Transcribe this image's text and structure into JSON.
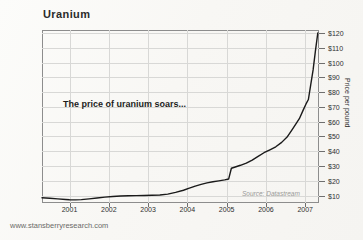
{
  "title": "Uranium",
  "annotation": "The price of uranium soars...",
  "source_note": "Source: Datastream",
  "footer_url": "www.stansberryresearch.com",
  "colors": {
    "line": "#1a1a1a",
    "grid": "#d8d8d6",
    "frame": "#8d8d8d",
    "text": "#2f2f2f",
    "source_text": "#9a9a98",
    "background": "#fbfaf8"
  },
  "chart_data": {
    "type": "line",
    "title": "Uranium",
    "xlabel": "",
    "ylabel": "Price per pound",
    "annotation": "The price of uranium soars...",
    "source": "Source: Datastream",
    "grid": true,
    "legend": "none",
    "xlim": [
      2000.3,
      2007.35
    ],
    "ylim": [
      5,
      122
    ],
    "xticks": [
      "2001",
      "2002",
      "2003",
      "2004",
      "2005",
      "2006",
      "2007"
    ],
    "ytick_labels": [
      "$10",
      "$20",
      "$30",
      "$40",
      "$50",
      "$60",
      "$70",
      "$80",
      "$90",
      "$100",
      "$110",
      "$120"
    ],
    "ytick_values": [
      10,
      20,
      30,
      40,
      50,
      60,
      70,
      80,
      90,
      100,
      110,
      120
    ],
    "series": [
      {
        "name": "Uranium spot price (US$ per pound)",
        "x": [
          2000.3,
          2000.5,
          2000.7,
          2000.9,
          2001.0,
          2001.15,
          2001.3,
          2001.5,
          2001.7,
          2001.9,
          2002.1,
          2002.3,
          2002.5,
          2002.7,
          2002.9,
          2003.1,
          2003.3,
          2003.5,
          2003.7,
          2003.9,
          2004.05,
          2004.2,
          2004.35,
          2004.5,
          2004.65,
          2004.8,
          2004.95,
          2005.05,
          2005.12,
          2005.2,
          2005.35,
          2005.5,
          2005.65,
          2005.8,
          2005.95,
          2006.1,
          2006.25,
          2006.4,
          2006.55,
          2006.65,
          2006.75,
          2006.85,
          2006.95,
          2007.02,
          2007.08,
          2007.14,
          2007.2,
          2007.26,
          2007.32
        ],
        "y": [
          8.5,
          8.2,
          7.8,
          7.4,
          7.2,
          7.1,
          7.3,
          7.8,
          8.4,
          9.0,
          9.4,
          9.7,
          9.9,
          10.0,
          10.1,
          10.2,
          10.4,
          11.0,
          12.2,
          13.6,
          15.0,
          16.4,
          17.6,
          18.6,
          19.4,
          20.0,
          20.6,
          21.2,
          28.5,
          29.2,
          30.5,
          32.0,
          34.0,
          36.5,
          39.0,
          41.0,
          43.0,
          46.0,
          50.0,
          54.0,
          58.0,
          62.0,
          68.0,
          72.0,
          75.0,
          85.0,
          95.0,
          108.0,
          120.0
        ]
      }
    ]
  }
}
